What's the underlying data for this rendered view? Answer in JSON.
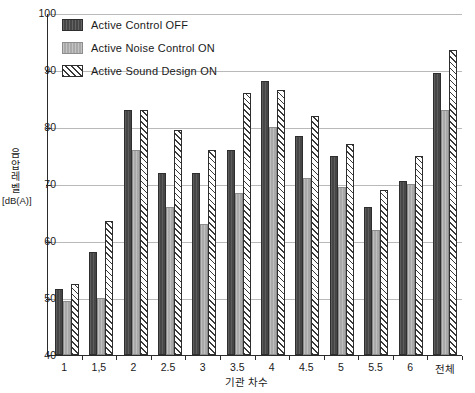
{
  "chart_data": {
    "type": "bar",
    "title": "",
    "xlabel": "기관 차수",
    "ylabel": "음압레벨 [dB(A)]",
    "ylabel_chars": [
      "음",
      "압",
      "레",
      "벨"
    ],
    "ylabel_unit": "[dB(A)]",
    "ylim": [
      40,
      100
    ],
    "yticks": [
      40,
      50,
      60,
      70,
      80,
      90,
      100
    ],
    "ytick_labels": [
      "40",
      "50",
      "60",
      "70",
      "80",
      "90",
      "100"
    ],
    "grid": true,
    "legend_position": "top-left",
    "categories": [
      "1",
      "1,5",
      "2",
      "2.5",
      "3",
      "3.5",
      "4",
      "4.5",
      "5",
      "5.5",
      "6",
      "전체"
    ],
    "series": [
      {
        "name": "Active Control OFF",
        "style": "dark-solid",
        "color": "#464646",
        "values": [
          51.5,
          58.0,
          83.0,
          72.0,
          72.0,
          76.0,
          88.0,
          78.5,
          75.0,
          66.0,
          70.5,
          89.5
        ]
      },
      {
        "name": "Active Noise Control ON",
        "style": "gray-solid",
        "color": "#a9a9a9",
        "values": [
          49.5,
          50.0,
          76.0,
          66.0,
          63.0,
          68.5,
          80.0,
          71.0,
          69.5,
          62.0,
          70.0,
          83.0
        ]
      },
      {
        "name": "Active Sound Design ON",
        "style": "diagonal-hatch",
        "color": "#ffffff",
        "values": [
          52.5,
          63.5,
          83.0,
          79.5,
          76.0,
          86.0,
          86.5,
          82.0,
          77.0,
          69.0,
          75.0,
          93.5
        ]
      }
    ]
  },
  "legend": {
    "items": [
      {
        "label": "Active Control OFF",
        "style": "off"
      },
      {
        "label": "Active Noise Control ON",
        "style": "noise"
      },
      {
        "label": "Active Sound Design ON",
        "style": "design"
      }
    ]
  }
}
